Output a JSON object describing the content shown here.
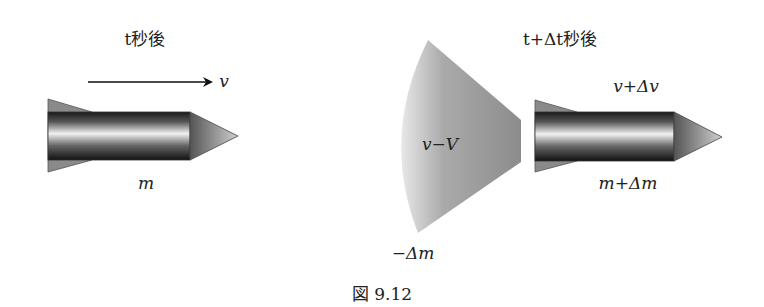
{
  "figure": {
    "caption": "図 9.12",
    "before": {
      "title": "t秒後",
      "velocity_label": "v",
      "mass_label": "m"
    },
    "after": {
      "title": "t+Δt秒後",
      "velocity_label": "v+Δv",
      "mass_label": "m+Δm"
    },
    "exhaust": {
      "velocity_label": "v−V",
      "mass_label": "−Δm"
    }
  }
}
